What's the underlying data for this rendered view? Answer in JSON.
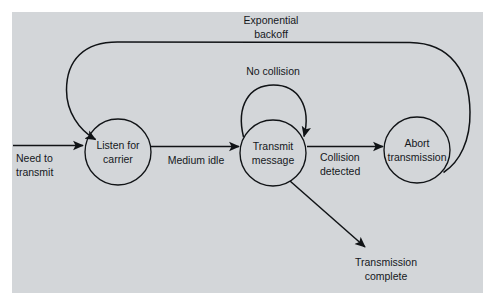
{
  "figure": {
    "panel_color": "#d3d6d9",
    "page_color": "#ffffff",
    "line_color": "#101316",
    "text_color": "#15181c"
  },
  "states": [
    {
      "id": "listen",
      "name": "listen-for-carrier",
      "line1": "Listen for",
      "line2": "carrier",
      "cx": 118,
      "cy": 152,
      "r": 33
    },
    {
      "id": "transmit",
      "name": "transmit-message",
      "line1": "Transmit",
      "line2": "message",
      "cx": 273,
      "cy": 153,
      "r": 33
    },
    {
      "id": "abort",
      "name": "abort-transmission",
      "line1": "Abort",
      "line2": "transmission",
      "cx": 417,
      "cy": 150,
      "r": 33
    }
  ],
  "edge_labels": [
    {
      "id": "need",
      "line1": "Need to",
      "line2": "transmit",
      "x": 42,
      "y": 162
    },
    {
      "id": "medium_idle",
      "line1": "Medium idle",
      "line2": "",
      "x": 196,
      "y": 163
    },
    {
      "id": "collision",
      "line1": "Collision",
      "line2": "detected",
      "x": 344,
      "y": 160
    },
    {
      "id": "no_collision",
      "line1": "No collision",
      "line2": "",
      "x": 273,
      "y": 74
    },
    {
      "id": "backoff",
      "line1": "Exponential",
      "line2": "backoff",
      "x": 271,
      "y": 24
    },
    {
      "id": "complete",
      "line1": "Transmission",
      "line2": "complete",
      "x": 386,
      "y": 266
    }
  ],
  "transitions": [
    {
      "id": "t1",
      "from": "start",
      "to": "listen",
      "label": "Need to transmit"
    },
    {
      "id": "t2",
      "from": "listen",
      "to": "transmit",
      "label": "Medium idle"
    },
    {
      "id": "t3",
      "from": "transmit",
      "to": "transmit",
      "label": "No collision"
    },
    {
      "id": "t4",
      "from": "transmit",
      "to": "abort",
      "label": "Collision detected"
    },
    {
      "id": "t5",
      "from": "abort",
      "to": "listen",
      "label": "Exponential backoff"
    },
    {
      "id": "t6",
      "from": "transmit",
      "to": "end",
      "label": "Transmission complete"
    }
  ]
}
